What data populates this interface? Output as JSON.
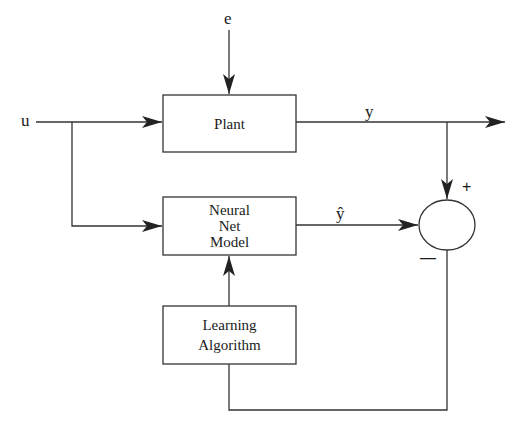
{
  "diagram": {
    "colors": {
      "line": "#333333",
      "background": "#ffffff",
      "text": "#1a1a1a"
    },
    "signals": {
      "input": "u",
      "disturbance": "e",
      "plant_output": "y",
      "model_output": "ŷ"
    },
    "blocks": [
      {
        "id": "plant",
        "lines": [
          "Plant"
        ]
      },
      {
        "id": "neural-net-model",
        "lines": [
          "Neural",
          "Net",
          "Model"
        ]
      },
      {
        "id": "learning-algorithm",
        "lines": [
          "Learning",
          "Algorithm"
        ]
      }
    ],
    "summing_junction": {
      "plus_sign": "+",
      "minus_sign": "—"
    }
  }
}
